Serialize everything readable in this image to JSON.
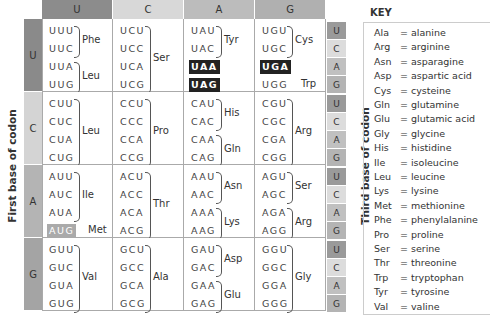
{
  "axes": {
    "first_base_label": "First base of codon",
    "second_base_label": "Second base of codon",
    "third_base_label": "Third base of codon"
  },
  "bases": [
    "U",
    "C",
    "A",
    "G"
  ],
  "colors": {
    "header": [
      "#8c8c8c",
      "#d8d8d8",
      "#bcbcbc",
      "#b0b0b0"
    ],
    "left": [
      "#8a8a8a",
      "#d4d4d4",
      "#b4b4b4",
      "#a4a4a4"
    ],
    "third": [
      "#9a9a9a",
      "#dcdcdc",
      "#c0c0c0",
      "#b4b4b4"
    ],
    "stop": "#222222",
    "start": "#aaaaaa"
  },
  "table": {
    "rows": [
      {
        "first": "U",
        "cells": [
          {
            "codons": [
              "UUU",
              "UUC",
              "UUA",
              "UUG"
            ],
            "groups": [
              {
                "aa": "Phe",
                "span": [
                  0,
                  1
                ]
              },
              {
                "aa": "Leu",
                "span": [
                  2,
                  3
                ]
              }
            ]
          },
          {
            "codons": [
              "UCU",
              "UCC",
              "UCA",
              "UCG"
            ],
            "groups": [
              {
                "aa": "Ser",
                "span": [
                  0,
                  3
                ]
              }
            ]
          },
          {
            "codons": [
              "UAU",
              "UAC",
              "UAA",
              "UAG"
            ],
            "groups": [
              {
                "aa": "Tyr",
                "span": [
                  0,
                  1
                ]
              }
            ],
            "stop": [
              2,
              3
            ]
          },
          {
            "codons": [
              "UGU",
              "UGC",
              "UGA",
              "UGG"
            ],
            "groups": [
              {
                "aa": "Cys",
                "span": [
                  0,
                  1
                ]
              }
            ],
            "stop": [
              2
            ],
            "single": [
              {
                "idx": 3,
                "aa": "Trp"
              }
            ]
          }
        ]
      },
      {
        "first": "C",
        "cells": [
          {
            "codons": [
              "CUU",
              "CUC",
              "CUA",
              "CUG"
            ],
            "groups": [
              {
                "aa": "Leu",
                "span": [
                  0,
                  3
                ]
              }
            ]
          },
          {
            "codons": [
              "CCU",
              "CCC",
              "CCA",
              "CCG"
            ],
            "groups": [
              {
                "aa": "Pro",
                "span": [
                  0,
                  3
                ]
              }
            ]
          },
          {
            "codons": [
              "CAU",
              "CAC",
              "CAA",
              "CAG"
            ],
            "groups": [
              {
                "aa": "His",
                "span": [
                  0,
                  1
                ]
              },
              {
                "aa": "Gln",
                "span": [
                  2,
                  3
                ]
              }
            ]
          },
          {
            "codons": [
              "CGU",
              "CGC",
              "CGA",
              "CGG"
            ],
            "groups": [
              {
                "aa": "Arg",
                "span": [
                  0,
                  3
                ]
              }
            ]
          }
        ]
      },
      {
        "first": "A",
        "cells": [
          {
            "codons": [
              "AUU",
              "AUC",
              "AUA",
              "AUG"
            ],
            "groups": [
              {
                "aa": "Ile",
                "span": [
                  0,
                  2
                ]
              }
            ],
            "start": [
              3
            ],
            "single": [
              {
                "idx": 3,
                "aa": "Met"
              }
            ]
          },
          {
            "codons": [
              "ACU",
              "ACC",
              "ACA",
              "ACG"
            ],
            "groups": [
              {
                "aa": "Thr",
                "span": [
                  0,
                  3
                ]
              }
            ]
          },
          {
            "codons": [
              "AAU",
              "AAC",
              "AAA",
              "AAG"
            ],
            "groups": [
              {
                "aa": "Asn",
                "span": [
                  0,
                  1
                ]
              },
              {
                "aa": "Lys",
                "span": [
                  2,
                  3
                ]
              }
            ]
          },
          {
            "codons": [
              "AGU",
              "AGC",
              "AGA",
              "AGG"
            ],
            "groups": [
              {
                "aa": "Ser",
                "span": [
                  0,
                  1
                ]
              },
              {
                "aa": "Arg",
                "span": [
                  2,
                  3
                ]
              }
            ]
          }
        ]
      },
      {
        "first": "G",
        "cells": [
          {
            "codons": [
              "GUU",
              "GUC",
              "GUA",
              "GUG"
            ],
            "groups": [
              {
                "aa": "Val",
                "span": [
                  0,
                  3
                ]
              }
            ]
          },
          {
            "codons": [
              "GCU",
              "GCC",
              "GCA",
              "GCG"
            ],
            "groups": [
              {
                "aa": "Ala",
                "span": [
                  0,
                  3
                ]
              }
            ]
          },
          {
            "codons": [
              "GAU",
              "GAC",
              "GAA",
              "GAG"
            ],
            "groups": [
              {
                "aa": "Asp",
                "span": [
                  0,
                  1
                ]
              },
              {
                "aa": "Glu",
                "span": [
                  2,
                  3
                ]
              }
            ]
          },
          {
            "codons": [
              "GGU",
              "GGC",
              "GGA",
              "GGG"
            ],
            "groups": [
              {
                "aa": "Gly",
                "span": [
                  0,
                  3
                ]
              }
            ]
          }
        ]
      }
    ]
  },
  "key": {
    "title": "KEY",
    "items": [
      {
        "abbr": "Ala",
        "name": "= alanine"
      },
      {
        "abbr": "Arg",
        "name": "= arginine"
      },
      {
        "abbr": "Asn",
        "name": "= asparagine"
      },
      {
        "abbr": "Asp",
        "name": "= aspartic acid"
      },
      {
        "abbr": "Cys",
        "name": "= cysteine"
      },
      {
        "abbr": "Gln",
        "name": "= glutamine"
      },
      {
        "abbr": "Glu",
        "name": "= glutamic acid"
      },
      {
        "abbr": "Gly",
        "name": "= glycine"
      },
      {
        "abbr": "His",
        "name": "= histidine"
      },
      {
        "abbr": "Ile",
        "name": "= isoleucine"
      },
      {
        "abbr": "Leu",
        "name": "= leucine"
      },
      {
        "abbr": "Lys",
        "name": "= lysine"
      },
      {
        "abbr": "Met",
        "name": "= methionine"
      },
      {
        "abbr": "Phe",
        "name": "= phenylalanine"
      },
      {
        "abbr": "Pro",
        "name": "= proline"
      },
      {
        "abbr": "Ser",
        "name": "= serine"
      },
      {
        "abbr": "Thr",
        "name": "= threonine"
      },
      {
        "abbr": "Trp",
        "name": "= tryptophan"
      },
      {
        "abbr": "Tyr",
        "name": "= tyrosine"
      },
      {
        "abbr": "Val",
        "name": "= valine"
      }
    ]
  }
}
